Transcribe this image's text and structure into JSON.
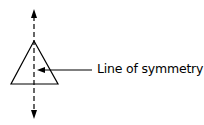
{
  "diagram": {
    "shape": "isosceles-triangle",
    "label": "Line of symmetry",
    "colors": {
      "stroke": "#000000",
      "background": "#ffffff"
    }
  }
}
